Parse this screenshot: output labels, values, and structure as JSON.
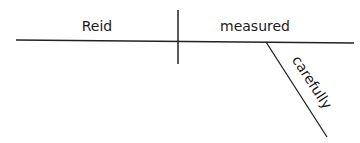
{
  "diagram": {
    "type": "sentence-diagram",
    "words": {
      "subject": "Reid",
      "verb": "measured",
      "modifier": "carefully"
    },
    "colors": {
      "line": "#222222",
      "text": "#1a1a1a",
      "background": "#ffffff"
    }
  }
}
